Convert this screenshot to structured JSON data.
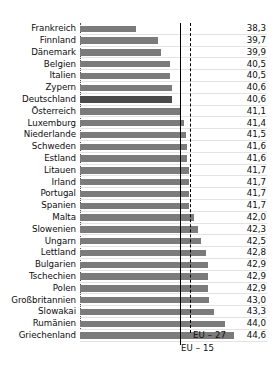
{
  "chart_data": {
    "type": "bar",
    "orientation": "horizontal",
    "title": "",
    "subtitle": "",
    "xlabel": "",
    "ylabel": "",
    "xlim": [
      34.7,
      44.9
    ],
    "grid": true,
    "legend_position": "inline-bottom",
    "value_decimal_separator": ",",
    "categories": [
      "Frankreich",
      "Finnland",
      "Dänemark",
      "Belgien",
      "Italien",
      "Zypern",
      "Deutschland",
      "Österreich",
      "Luxemburg",
      "Niederlande",
      "Schweden",
      "Estland",
      "Litauen",
      "Irland",
      "Portugal",
      "Spanien",
      "Malta",
      "Slowenien",
      "Ungarn",
      "Lettland",
      "Bulgarien",
      "Tschechien",
      "Polen",
      "Großbritannien",
      "Slowakai",
      "Rumänien",
      "Griechenland"
    ],
    "values": [
      38.3,
      39.7,
      39.9,
      40.5,
      40.5,
      40.6,
      40.6,
      41.1,
      41.4,
      41.5,
      41.6,
      41.6,
      41.7,
      41.7,
      41.7,
      41.7,
      42.0,
      42.3,
      42.5,
      42.8,
      42.9,
      42.9,
      42.9,
      43.0,
      43.3,
      44.0,
      44.6
    ],
    "value_labels": [
      "38,3",
      "39,7",
      "39,9",
      "40,5",
      "40,5",
      "40,6",
      "40,6",
      "41,1",
      "41,4",
      "41,5",
      "41,6",
      "41,6",
      "41,7",
      "41,7",
      "41,7",
      "41,7",
      "42,0",
      "42,3",
      "42,5",
      "42,8",
      "42,9",
      "42,9",
      "42,9",
      "43,0",
      "43,3",
      "44,0",
      "44,6"
    ],
    "highlighted_category": "Deutschland",
    "reference_lines": [
      {
        "name": "EU - 15",
        "label": "EU – 15",
        "value": 41.13,
        "style": "solid"
      },
      {
        "name": "EU - 27",
        "label": "EU – 27",
        "value": 41.77,
        "style": "dashed"
      }
    ],
    "colors": {
      "bar": "#7b7b7b",
      "bar_highlight": "#4a4a4a",
      "gridline": "#e3e3e3",
      "axis": "#4d4d4d",
      "text": "#0d0d0d",
      "background": "#ffffff"
    }
  }
}
